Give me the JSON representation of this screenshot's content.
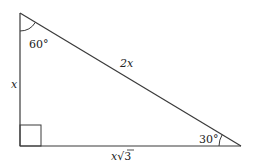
{
  "diagram": {
    "type": "right-triangle-30-60-90",
    "stroke_color": "#3a3a3a",
    "vertices": {
      "top": {
        "x": 20,
        "y": 13
      },
      "right_angle": {
        "x": 20,
        "y": 146
      },
      "right": {
        "x": 241,
        "y": 146
      }
    },
    "angles": {
      "top": "60°",
      "right": "30°",
      "bottom_left": "right-angle"
    },
    "sides": {
      "vertical": "x",
      "hypotenuse": "2x",
      "base_prefix": "x",
      "base_radical": "√",
      "base_radicand": "3"
    }
  }
}
